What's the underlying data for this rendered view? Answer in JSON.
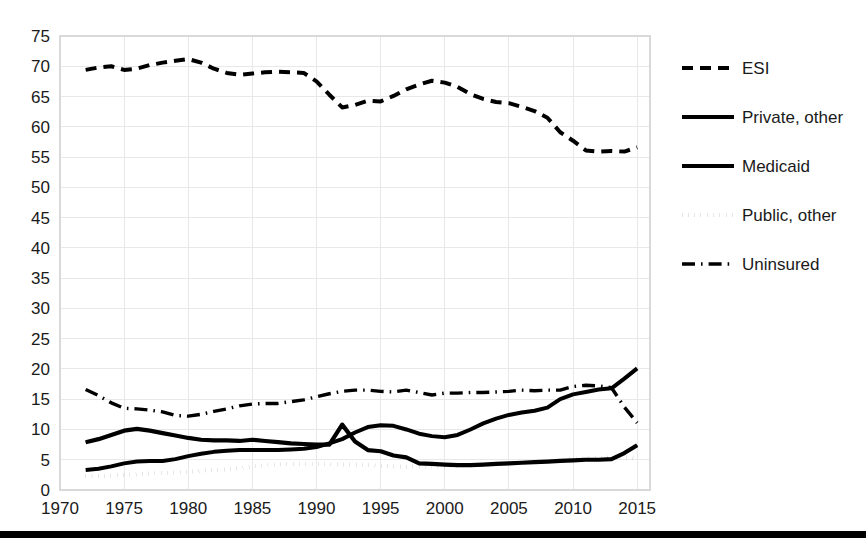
{
  "chart_data": {
    "type": "line",
    "title": "",
    "subtitle": "",
    "xlabel": "",
    "ylabel": "",
    "xlim": [
      1970,
      2016
    ],
    "ylim": [
      0,
      75
    ],
    "grid": true,
    "legend_position": "right",
    "x_ticks": [
      "1970",
      "1975",
      "1980",
      "1985",
      "1990",
      "1995",
      "2000",
      "2005",
      "2010",
      "2015"
    ],
    "y_ticks": [
      "0",
      "5",
      "10",
      "15",
      "20",
      "25",
      "30",
      "35",
      "40",
      "45",
      "50",
      "55",
      "60",
      "65",
      "70",
      "75"
    ],
    "x": [
      1972,
      1973,
      1974,
      1975,
      1976,
      1977,
      1978,
      1979,
      1980,
      1981,
      1982,
      1983,
      1984,
      1985,
      1986,
      1987,
      1988,
      1989,
      1990,
      1991,
      1992,
      1993,
      1994,
      1995,
      1996,
      1997,
      1998,
      1999,
      2000,
      2001,
      2002,
      2003,
      2004,
      2005,
      2006,
      2007,
      2008,
      2009,
      2010,
      2011,
      2012,
      2013,
      2014,
      2015
    ],
    "series": [
      {
        "name": "ESI",
        "style": "dashed",
        "values": [
          69.4,
          69.8,
          70.0,
          69.4,
          69.6,
          70.2,
          70.6,
          70.9,
          71.2,
          70.6,
          69.6,
          68.9,
          68.6,
          68.8,
          69.0,
          69.1,
          69.0,
          68.9,
          67.5,
          65.3,
          63.2,
          63.6,
          64.3,
          64.2,
          65.1,
          66.2,
          67.0,
          67.6,
          67.3,
          66.6,
          65.4,
          64.6,
          64.1,
          63.9,
          63.3,
          62.6,
          61.5,
          59.1,
          57.7,
          56.1,
          55.9,
          56.0,
          55.9,
          56.6
        ]
      },
      {
        "name": "Private, other",
        "style": "double",
        "values": [
          7.9,
          8.4,
          9.1,
          9.8,
          10.1,
          9.8,
          9.4,
          9.0,
          8.6,
          8.3,
          8.2,
          8.2,
          8.1,
          8.3,
          8.1,
          7.9,
          7.7,
          7.6,
          7.5,
          7.5,
          10.8,
          8.0,
          6.6,
          6.4,
          5.7,
          5.4,
          4.4,
          4.3,
          4.2,
          4.1,
          4.1,
          4.2,
          4.3,
          4.4,
          4.5,
          4.6,
          4.7,
          4.8,
          4.9,
          5.0,
          5.0,
          5.1,
          6.1,
          7.4
        ]
      },
      {
        "name": "Medicaid",
        "style": "solid",
        "values": [
          3.3,
          3.5,
          3.9,
          4.4,
          4.7,
          4.8,
          4.8,
          5.1,
          5.6,
          6.0,
          6.3,
          6.5,
          6.6,
          6.6,
          6.6,
          6.6,
          6.7,
          6.8,
          7.1,
          7.7,
          8.4,
          9.5,
          10.4,
          10.7,
          10.6,
          10.0,
          9.3,
          8.9,
          8.7,
          9.1,
          10.0,
          11.0,
          11.8,
          12.4,
          12.8,
          13.1,
          13.6,
          15.0,
          15.8,
          16.2,
          16.6,
          16.8,
          18.4,
          20.1
        ]
      },
      {
        "name": "Public, other",
        "style": "dotted",
        "values": [
          2.3,
          2.3,
          2.4,
          2.5,
          2.6,
          2.7,
          2.8,
          2.9,
          3.0,
          3.2,
          3.3,
          3.4,
          3.6,
          3.9,
          4.1,
          4.2,
          4.3,
          4.3,
          4.3,
          4.3,
          4.2,
          4.2,
          4.1,
          4.0,
          3.9,
          3.8,
          3.9,
          3.9,
          3.9,
          4.0,
          4.1,
          4.2,
          4.3,
          4.4,
          4.5,
          4.6,
          4.7,
          4.9,
          5.1,
          5.2,
          5.3,
          5.4,
          5.4,
          5.3
        ]
      },
      {
        "name": "Uninsured",
        "style": "dashdot",
        "values": [
          16.6,
          15.6,
          14.4,
          13.5,
          13.4,
          13.2,
          12.9,
          12.3,
          12.2,
          12.5,
          13.0,
          13.4,
          13.9,
          14.2,
          14.3,
          14.3,
          14.6,
          14.9,
          15.4,
          15.9,
          16.3,
          16.5,
          16.5,
          16.3,
          16.2,
          16.5,
          16.1,
          15.7,
          16.0,
          16.0,
          16.1,
          16.1,
          16.2,
          16.3,
          16.5,
          16.4,
          16.5,
          16.5,
          17.1,
          17.3,
          17.2,
          16.9,
          13.7,
          11.1
        ]
      }
    ]
  },
  "legend": {
    "items": [
      {
        "label": "ESI",
        "style": "dashed"
      },
      {
        "label": "Private, other",
        "style": "double"
      },
      {
        "label": "Medicaid",
        "style": "solid"
      },
      {
        "label": "Public, other",
        "style": "dotted"
      },
      {
        "label": "Uninsured",
        "style": "dashdot"
      }
    ]
  }
}
